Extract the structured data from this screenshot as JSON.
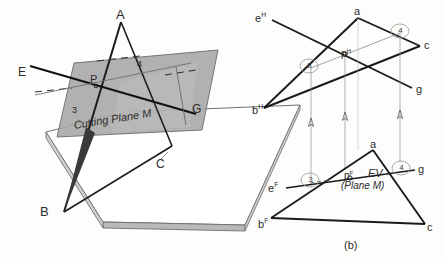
{
  "figure": {
    "caption_b": "(b)",
    "pictorial": {
      "label_A": "A",
      "label_B": "B",
      "label_C": "C",
      "label_E": "E",
      "label_G": "G",
      "label_P": "P",
      "label_3": "3",
      "label_4": "4",
      "plane_caption": "Cutting Plane M"
    },
    "top_view": {
      "label_a": "a",
      "label_c": "c",
      "label_g": "g",
      "label_e": "e",
      "label_e_sup": "H",
      "label_b": "b",
      "label_b_sup": "H",
      "label_p": "p",
      "label_p_sup": "H",
      "circled_3": "3",
      "circled_4": "4"
    },
    "front_view": {
      "label_a": "a",
      "label_c": "c",
      "label_g": "g",
      "label_e": "e",
      "label_e_sup": "F",
      "label_b": "b",
      "label_b_sup": "F",
      "label_p": "p",
      "label_p_sup": "F",
      "label_ev": "EV",
      "label_plane_m": "(Plane M)",
      "circled_3": "3",
      "circled_4": "4"
    }
  },
  "colors": {
    "ink": "#2b2b2b",
    "line": "#222222",
    "plane_fill": "#a8a8a8",
    "plane_fill_light": "#bcbcbc",
    "ground_top": "#fefefe",
    "ground_edge": "#8e8e8e",
    "thin_line": "#777777"
  }
}
